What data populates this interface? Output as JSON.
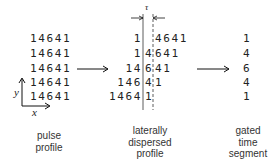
{
  "pulse_profile": {
    "rows": [
      "14641",
      "14641",
      "14641",
      "14641",
      "14641"
    ],
    "label_lines": [
      "pulse",
      "profile"
    ],
    "axis": {
      "x_label": "x",
      "y_label": "y"
    }
  },
  "dispersed_profile": {
    "rows": [
      {
        "left": "1",
        "mid": "",
        "right": "4641",
        "pre": ""
      },
      {
        "left": "1",
        "mid": "4",
        "right": "641",
        "pre": ""
      },
      {
        "left": "14",
        "mid": "6",
        "right": "41",
        "pre": ""
      },
      {
        "left": "146",
        "mid": "4",
        "right": "1",
        "pre": ""
      },
      {
        "left": "1464",
        "mid": "1",
        "right": "",
        "pre": ""
      }
    ],
    "gate_width_symbol": "τ",
    "label_lines": [
      "laterally",
      "dispersed",
      "profile"
    ]
  },
  "gated_segment": {
    "values": [
      "1",
      "4",
      "6",
      "4",
      "1"
    ],
    "label_lines": [
      "gated",
      "time",
      "segment"
    ]
  }
}
